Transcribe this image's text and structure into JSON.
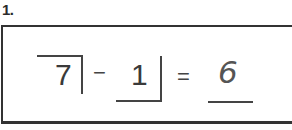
{
  "problem": {
    "number_label": "1.",
    "operand_1": "7",
    "operator": "−",
    "operand_2": "1",
    "equals": "=",
    "answer": "6"
  }
}
